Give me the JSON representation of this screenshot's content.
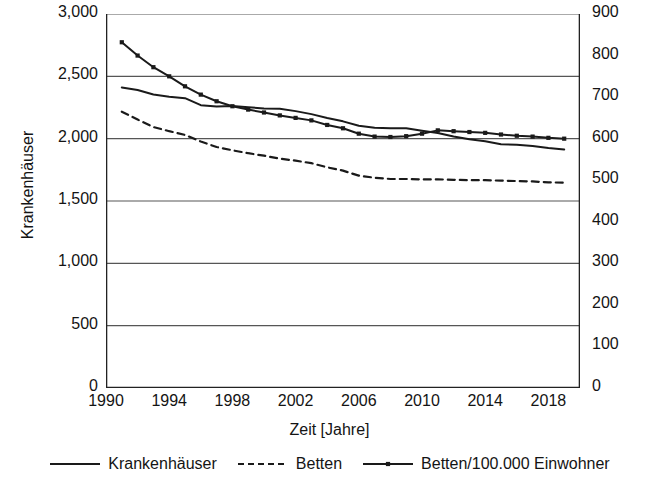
{
  "chart_data": {
    "type": "line",
    "title": "",
    "xlabel": "Zeit [Jahre]",
    "ylabel": "Krankenhäuser",
    "ylabel_right": "Betten*1000; Betten/100.000 Einwohner",
    "grid": true,
    "legend_position": "bottom",
    "xlim": [
      1990,
      2020
    ],
    "xticks": [
      1990,
      1994,
      1998,
      2002,
      2006,
      2010,
      2014,
      2018
    ],
    "ylim": [
      0,
      3000
    ],
    "yticks": [
      0,
      500,
      1000,
      1500,
      2000,
      2500,
      3000
    ],
    "ytick_labels": [
      "0",
      "500",
      "1,000",
      "1,500",
      "2,000",
      "2,500",
      "3,000"
    ],
    "ylim_right": [
      0,
      900
    ],
    "yticks_right": [
      0,
      100,
      200,
      300,
      400,
      500,
      600,
      700,
      800,
      900
    ],
    "ytick_labels_right": [
      "0",
      "100",
      "200",
      "300",
      "400",
      "500",
      "600",
      "700",
      "800",
      "900"
    ],
    "x": [
      1991,
      1992,
      1993,
      1994,
      1995,
      1996,
      1997,
      1998,
      1999,
      2000,
      2001,
      2002,
      2003,
      2004,
      2005,
      2006,
      2007,
      2008,
      2009,
      2010,
      2011,
      2012,
      2013,
      2014,
      2015,
      2016,
      2017,
      2018,
      2019
    ],
    "series": [
      {
        "name": "Krankenhäuser",
        "axis": "left",
        "style": "solid",
        "markers": false,
        "color": "#1a1a1a",
        "values": [
          2411,
          2390,
          2354,
          2337,
          2325,
          2269,
          2258,
          2263,
          2252,
          2242,
          2240,
          2221,
          2197,
          2166,
          2139,
          2104,
          2087,
          2083,
          2084,
          2064,
          2045,
          2017,
          1996,
          1980,
          1956,
          1951,
          1942,
          1925,
          1914
        ]
      },
      {
        "name": "Betten",
        "axis": "right",
        "style": "dashed",
        "markers": false,
        "color": "#1a1a1a",
        "values": [
          665,
          646,
          628,
          618,
          609,
          593,
          580,
          572,
          565,
          559,
          552,
          547,
          541,
          531,
          523,
          511,
          506,
          503,
          503,
          502,
          502,
          501,
          500,
          500,
          499,
          498,
          497,
          495,
          494
        ]
      },
      {
        "name": "Betten/100.000 Einwohner",
        "axis": "right",
        "style": "solid",
        "markers": true,
        "color": "#1a1a1a",
        "values": [
          832,
          800,
          772,
          750,
          726,
          706,
          690,
          678,
          670,
          663,
          656,
          650,
          644,
          633,
          625,
          612,
          605,
          604,
          606,
          612,
          620,
          618,
          616,
          614,
          610,
          607,
          605,
          602,
          600
        ]
      }
    ]
  },
  "axes": {
    "ylabel_left": "Krankenhäuser",
    "ylabel_right": "Betten*1000; Betten/100.000 Einwohner",
    "xlabel": "Zeit [Jahre]"
  },
  "legend": {
    "items": [
      {
        "label": "Krankenhäuser",
        "style": "solid",
        "markers": false
      },
      {
        "label": "Betten",
        "style": "dashed",
        "markers": false
      },
      {
        "label": "Betten/100.000 Einwohner",
        "style": "solid",
        "markers": true
      }
    ]
  }
}
